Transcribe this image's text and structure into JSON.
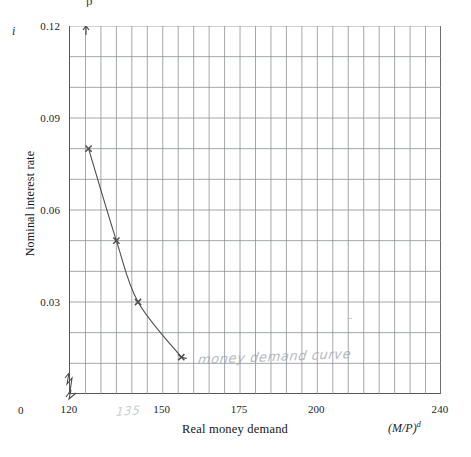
{
  "figure": {
    "top_clipped_text": "p",
    "y_symbol": "i",
    "x_symbol_base": "(M/P)",
    "x_symbol_sup": "d",
    "x_origin_label": "0",
    "annotation_handwritten": "money demand curve",
    "annotation_handwritten_x": "135",
    "stray_mark": "stray-pencil-mark"
  },
  "chart_data": {
    "type": "line",
    "title": "",
    "subtitle": "",
    "xlabel": "Real money demand",
    "ylabel": "Nominal interest rate",
    "x_symbol": "(M/P)d",
    "y_symbol": "i",
    "xlim": [
      120,
      240
    ],
    "ylim": [
      0,
      0.12
    ],
    "grid": true,
    "grid_x_step": 5,
    "grid_y_step": 0.01,
    "axis_break_x": true,
    "axis_break_y": true,
    "legend": "none",
    "x_ticks": [
      {
        "value": 120,
        "label": "120"
      },
      {
        "value": 150,
        "label": "150"
      },
      {
        "value": 175,
        "label": "175"
      },
      {
        "value": 200,
        "label": "200"
      },
      {
        "value": 240,
        "label": "240"
      }
    ],
    "y_ticks": [
      {
        "value": 0.03,
        "label": "0.03"
      },
      {
        "value": 0.06,
        "label": "0.06"
      },
      {
        "value": 0.09,
        "label": "0.09"
      },
      {
        "value": 0.12,
        "label": "0.12"
      }
    ],
    "series": [
      {
        "name": "money demand curve",
        "marker": "cross",
        "color": "#4d4d4d",
        "x": [
          126,
          135,
          142,
          156
        ],
        "y": [
          0.08,
          0.05,
          0.03,
          0.012
        ]
      }
    ]
  }
}
